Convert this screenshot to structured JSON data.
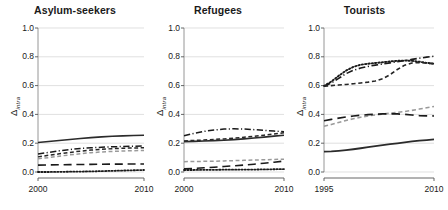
{
  "figure": {
    "ylabel_symbol": "Δ",
    "ylabel_subscript": "intra",
    "ytick_labels": [
      "1.0",
      "0.8",
      "0.6",
      "0.4",
      "0.2",
      "0.0"
    ]
  },
  "chart_data": {
    "type": "line",
    "title": "",
    "xlabel": "",
    "ylabel": "Δ_intra",
    "ylim": [
      0.0,
      1.0
    ],
    "yticks": [
      0.0,
      0.2,
      0.4,
      0.6,
      0.8,
      1.0
    ],
    "grid": true,
    "legend_position": "none",
    "panels": [
      {
        "title": "Asylum-seekers",
        "xlim": [
          2000,
          2010
        ],
        "xticks": [
          2000,
          2010
        ],
        "xtick_labels": [
          "2000",
          "2010"
        ],
        "x": [
          2000,
          2001,
          2002,
          2003,
          2004,
          2005,
          2006,
          2007,
          2008,
          2009,
          2010
        ],
        "series": [
          {
            "name": "series-solid-dark",
            "style": "solid",
            "color": "#2b2b2b",
            "width": 1.6,
            "values": [
              0.205,
              0.212,
              0.219,
              0.226,
              0.233,
              0.239,
              0.244,
              0.248,
              0.251,
              0.253,
              0.255
            ]
          },
          {
            "name": "series-dashdot-dark",
            "style": "dashdot",
            "color": "#1a1a1a",
            "width": 1.5,
            "values": [
              0.125,
              0.136,
              0.147,
              0.156,
              0.163,
              0.168,
              0.172,
              0.175,
              0.177,
              0.179,
              0.18
            ]
          },
          {
            "name": "series-dash-dark",
            "style": "dash",
            "color": "#262626",
            "width": 1.5,
            "values": [
              0.105,
              0.116,
              0.126,
              0.136,
              0.145,
              0.152,
              0.158,
              0.162,
              0.165,
              0.167,
              0.168
            ]
          },
          {
            "name": "series-dash-gray",
            "style": "dash",
            "color": "#9a9a9a",
            "width": 1.5,
            "values": [
              0.092,
              0.1,
              0.11,
              0.119,
              0.127,
              0.134,
              0.139,
              0.143,
              0.146,
              0.148,
              0.15
            ]
          },
          {
            "name": "series-longdash-dark",
            "style": "longdash",
            "color": "#1a1a1a",
            "width": 1.6,
            "values": [
              0.048,
              0.049,
              0.05,
              0.051,
              0.052,
              0.053,
              0.054,
              0.055,
              0.055,
              0.056,
              0.056
            ]
          },
          {
            "name": "series-dotted-dark",
            "style": "dotted",
            "color": "#1a1a1a",
            "width": 1.8,
            "values": [
              0.0,
              0.0,
              0.001,
              0.002,
              0.003,
              0.004,
              0.006,
              0.008,
              0.01,
              0.012,
              0.014
            ]
          }
        ]
      },
      {
        "title": "Refugees",
        "xlim": [
          2000,
          2010
        ],
        "xticks": [
          2000,
          2010
        ],
        "xtick_labels": [
          "2000",
          "2010"
        ],
        "x": [
          2000,
          2001,
          2002,
          2003,
          2004,
          2005,
          2006,
          2007,
          2008,
          2009,
          2010
        ],
        "series": [
          {
            "name": "series-dashdot-dark",
            "style": "dashdot",
            "color": "#1a1a1a",
            "width": 1.5,
            "values": [
              0.252,
              0.268,
              0.282,
              0.292,
              0.298,
              0.3,
              0.298,
              0.294,
              0.289,
              0.284,
              0.28
            ]
          },
          {
            "name": "series-dash-dark",
            "style": "dash",
            "color": "#262626",
            "width": 1.5,
            "values": [
              0.216,
              0.219,
              0.222,
              0.226,
              0.23,
              0.235,
              0.241,
              0.248,
              0.256,
              0.264,
              0.272
            ]
          },
          {
            "name": "series-solid-dark",
            "style": "solid",
            "color": "#2b2b2b",
            "width": 1.6,
            "values": [
              0.211,
              0.213,
              0.215,
              0.218,
              0.221,
              0.225,
              0.23,
              0.236,
              0.242,
              0.249,
              0.255
            ]
          },
          {
            "name": "series-dash-gray",
            "style": "dash",
            "color": "#9a9a9a",
            "width": 1.5,
            "values": [
              0.072,
              0.073,
              0.074,
              0.075,
              0.077,
              0.079,
              0.081,
              0.083,
              0.085,
              0.087,
              0.089
            ]
          },
          {
            "name": "series-longdash-dark",
            "style": "longdash",
            "color": "#1a1a1a",
            "width": 1.6,
            "values": [
              0.022,
              0.025,
              0.029,
              0.033,
              0.038,
              0.043,
              0.048,
              0.054,
              0.061,
              0.068,
              0.076
            ]
          },
          {
            "name": "series-dotted-dark",
            "style": "dotted",
            "color": "#1a1a1a",
            "width": 1.8,
            "values": [
              0.014,
              0.014,
              0.015,
              0.015,
              0.016,
              0.016,
              0.017,
              0.017,
              0.018,
              0.019,
              0.02
            ]
          }
        ]
      },
      {
        "title": "Tourists",
        "xlim": [
          1995,
          2010
        ],
        "xticks": [
          1995,
          2010
        ],
        "xtick_labels": [
          "1995",
          "2010"
        ],
        "x": [
          1995,
          1996,
          1997,
          1998,
          1999,
          2000,
          2001,
          2002,
          2003,
          2004,
          2005,
          2006,
          2007,
          2008,
          2009,
          2010
        ],
        "series": [
          {
            "name": "series-dotted-dark",
            "style": "dotted",
            "color": "#1a1a1a",
            "width": 1.9,
            "values": [
              0.598,
              0.628,
              0.668,
              0.704,
              0.73,
              0.745,
              0.752,
              0.757,
              0.762,
              0.768,
              0.772,
              0.774,
              0.772,
              0.766,
              0.758,
              0.752
            ]
          },
          {
            "name": "series-dashdot-dark",
            "style": "dashdot",
            "color": "#1a1a1a",
            "width": 1.6,
            "values": [
              0.596,
              0.618,
              0.65,
              0.683,
              0.706,
              0.722,
              0.733,
              0.742,
              0.75,
              0.758,
              0.766,
              0.774,
              0.782,
              0.79,
              0.798,
              0.804
            ]
          },
          {
            "name": "series-dash-dark",
            "style": "dash",
            "color": "#262626",
            "width": 1.6,
            "values": [
              0.596,
              0.6,
              0.604,
              0.608,
              0.613,
              0.618,
              0.624,
              0.632,
              0.648,
              0.676,
              0.712,
              0.742,
              0.757,
              0.76,
              0.756,
              0.752
            ]
          },
          {
            "name": "series-dash-gray",
            "style": "dash",
            "color": "#9a9a9a",
            "width": 1.6,
            "values": [
              0.318,
              0.33,
              0.344,
              0.358,
              0.37,
              0.38,
              0.389,
              0.396,
              0.402,
              0.408,
              0.414,
              0.42,
              0.428,
              0.437,
              0.446,
              0.455
            ]
          },
          {
            "name": "series-longdash-dark",
            "style": "longdash",
            "color": "#1a1a1a",
            "width": 1.7,
            "values": [
              0.356,
              0.365,
              0.374,
              0.382,
              0.389,
              0.394,
              0.398,
              0.401,
              0.403,
              0.404,
              0.403,
              0.4,
              0.396,
              0.392,
              0.39,
              0.389
            ]
          },
          {
            "name": "series-solid-dark",
            "style": "solid",
            "color": "#2b2b2b",
            "width": 1.8,
            "values": [
              0.141,
              0.143,
              0.147,
              0.152,
              0.158,
              0.165,
              0.172,
              0.179,
              0.186,
              0.193,
              0.199,
              0.206,
              0.212,
              0.218,
              0.222,
              0.226
            ]
          }
        ]
      }
    ]
  }
}
